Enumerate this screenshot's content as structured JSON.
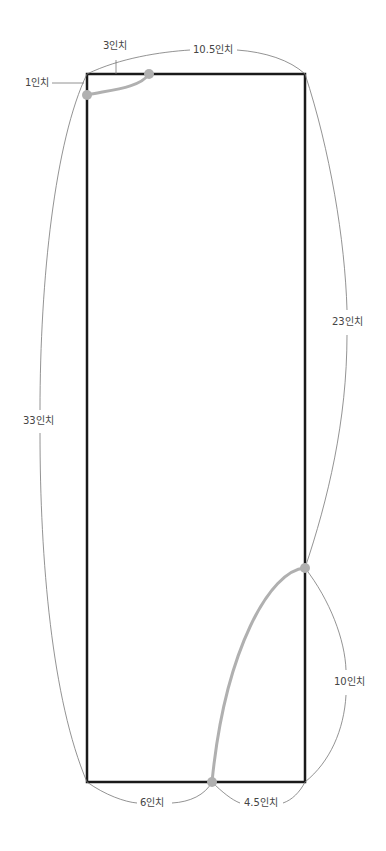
{
  "diagram": {
    "type": "sewing-pattern",
    "colors": {
      "outline": "#1a1a1a",
      "curve": "#b0b0b0",
      "dimension": "#777777",
      "text": "#444444"
    },
    "labels": {
      "top_width": "10.5인치",
      "neck_width": "3인치",
      "neck_depth": "1인치",
      "left_height": "33인치",
      "right_upper": "23인치",
      "right_lower": "10인치",
      "bottom_left": "6인치",
      "bottom_right": "4.5인치"
    }
  }
}
